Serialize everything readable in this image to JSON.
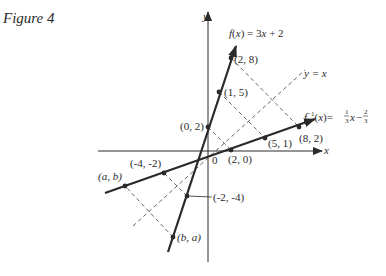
{
  "caption": "Figure 4",
  "axes": {
    "x_label": "x",
    "y_label": "y",
    "origin_label": "0"
  },
  "functions": {
    "f": {
      "label": "f(x) = 3x + 2",
      "slope": 3,
      "intercept": 2
    },
    "f_inverse": {
      "label": "f⁻¹(x) = ⅓x − ⅔",
      "slope": 0.3333,
      "intercept": -0.6667
    },
    "identity": {
      "label": "y = x"
    }
  },
  "points_on_f": [
    {
      "label": "(2, 8)",
      "x": 2,
      "y": 8
    },
    {
      "label": "(1, 5)",
      "x": 1,
      "y": 5
    },
    {
      "label": "(0, 2)",
      "x": 0,
      "y": 2
    },
    {
      "label": "(-2, -4)",
      "x": -2,
      "y": -4
    },
    {
      "label": "(b, a)",
      "x": -3.0,
      "y": -7.5
    }
  ],
  "points_on_f_inverse": [
    {
      "label": "(8, 2)",
      "x": 8,
      "y": 2
    },
    {
      "label": "(5, 1)",
      "x": 5,
      "y": 1
    },
    {
      "label": "(2, 0)",
      "x": 2,
      "y": 0
    },
    {
      "label": "(-4, -2)",
      "x": -4,
      "y": -2
    },
    {
      "label": "(a, b)",
      "x": -7.5,
      "y": -3.0
    }
  ],
  "reflection_pairs": [
    [
      "(2, 8)",
      "(8, 2)"
    ],
    [
      "(1, 5)",
      "(5, 1)"
    ],
    [
      "(0, 2)",
      "(2, 0)"
    ],
    [
      "(-2, -4)",
      "(-4, -2)"
    ],
    [
      "(b, a)",
      "(a, b)"
    ]
  ],
  "colors": {
    "ink": "#2a2a2a",
    "dashed": "#555555",
    "background": "#ffffff"
  }
}
